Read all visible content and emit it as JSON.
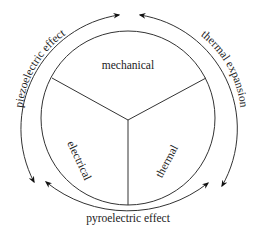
{
  "diagram": {
    "type": "triangle-of-couplings",
    "regions": {
      "top": "mechanical",
      "left": "electrical",
      "right": "thermal"
    },
    "effects": {
      "left_arc": "piezoelectric effect",
      "right_arc": "thermal expansion",
      "bottom_arc": "pyroelectric effect"
    },
    "colors": {
      "stroke": "#333333",
      "text": "#222222",
      "background": "#ffffff"
    }
  }
}
